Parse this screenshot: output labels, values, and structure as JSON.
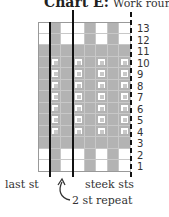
{
  "title": {
    "bold": "Chart E:",
    "sub": "Work rounds 1-1"
  },
  "chart": {
    "columns": 8,
    "rows": 13,
    "colors": {
      "contrast": "#b3b3b3",
      "main": "#ffffff",
      "grid": "#c8c8c8"
    },
    "legend_key": {
      "W": "main color",
      "G": "contrast color",
      "D": "contrast with dot symbol"
    },
    "row_patterns": {
      "13": [
        "W",
        "G",
        "W",
        "W",
        "G",
        "W",
        "G",
        "W"
      ],
      "12": [
        "W",
        "G",
        "W",
        "W",
        "G",
        "W",
        "G",
        "W"
      ],
      "11": [
        "G",
        "G",
        "G",
        "G",
        "G",
        "G",
        "G",
        "G"
      ],
      "10": [
        "G",
        "D",
        "G",
        "D",
        "G",
        "D",
        "G",
        "D"
      ],
      "9": [
        "G",
        "D",
        "G",
        "D",
        "G",
        "D",
        "G",
        "D"
      ],
      "8": [
        "G",
        "D",
        "G",
        "D",
        "G",
        "D",
        "G",
        "D"
      ],
      "7": [
        "G",
        "D",
        "G",
        "D",
        "G",
        "D",
        "G",
        "D"
      ],
      "6": [
        "G",
        "D",
        "G",
        "D",
        "G",
        "D",
        "G",
        "D"
      ],
      "5": [
        "G",
        "D",
        "G",
        "D",
        "G",
        "D",
        "G",
        "D"
      ],
      "4": [
        "G",
        "D",
        "G",
        "D",
        "G",
        "D",
        "G",
        "D"
      ],
      "3": [
        "G",
        "G",
        "G",
        "G",
        "G",
        "G",
        "G",
        "G"
      ],
      "2": [
        "W",
        "G",
        "W",
        "W",
        "G",
        "W",
        "G",
        "W"
      ],
      "1": [
        "W",
        "G",
        "W",
        "W",
        "G",
        "W",
        "G",
        "W"
      ]
    },
    "row_numbers": [
      "13",
      "12",
      "11",
      "10",
      "9",
      "8",
      "7",
      "6",
      "5",
      "4",
      "3",
      "2",
      "1"
    ]
  },
  "labels": {
    "last_st": "last st",
    "steek_sts": "steek sts",
    "repeat": "2 st repeat"
  }
}
